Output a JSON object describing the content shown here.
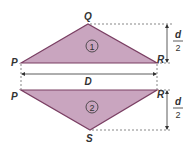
{
  "colors": {
    "fill": "#c9a5bf",
    "stroke": "#7a3f63",
    "line": "#333333"
  },
  "triangle1": {
    "label": "1",
    "vertices": {
      "P": "P",
      "Q": "Q",
      "R": "R"
    }
  },
  "triangle2": {
    "label": "2",
    "vertices": {
      "P": "P",
      "R": "R",
      "S": "S"
    }
  },
  "dimensions": {
    "width": "D",
    "height_num": "d",
    "height_den": "2"
  }
}
